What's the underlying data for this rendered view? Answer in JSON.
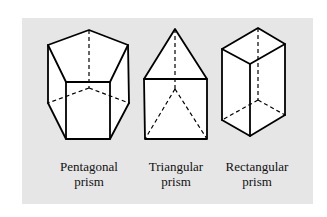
{
  "figure": {
    "background_color": "#e6e6e6",
    "shape_fill": "#ffffff",
    "line_color": "#000000",
    "prisms": [
      {
        "id": "pentagonal",
        "label_line1": "Pentagonal",
        "label_line2": "prism"
      },
      {
        "id": "triangular",
        "label_line1": "Triangular",
        "label_line2": "prism"
      },
      {
        "id": "rectangular",
        "label_line1": "Rectangular",
        "label_line2": "prism"
      }
    ]
  }
}
